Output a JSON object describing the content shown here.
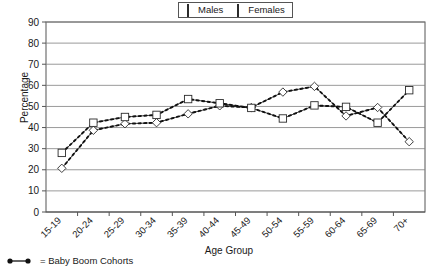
{
  "chart_data": {
    "type": "line",
    "title": "",
    "xlabel": "Age Group",
    "ylabel": "Percentage",
    "ylim": [
      0,
      90
    ],
    "ytick_step": 10,
    "yticks": [
      0,
      10,
      20,
      30,
      40,
      50,
      60,
      70,
      80,
      90
    ],
    "grid": "horizontal",
    "legend_position": "top-center",
    "categories": [
      "15-19",
      "20-24",
      "25-29",
      "30-34",
      "35-39",
      "40-44",
      "45-49",
      "50-54",
      "55-59",
      "60-64",
      "65-69",
      "70+"
    ],
    "series": [
      {
        "name": "Males",
        "marker": "diamond",
        "values": [
          20.7,
          38.7,
          41.8,
          42.3,
          46.5,
          50.3,
          49.5,
          56.8,
          59.5,
          45.5,
          49.5,
          33.3
        ]
      },
      {
        "name": "Females",
        "marker": "square",
        "values": [
          28.0,
          42.3,
          45.0,
          46.0,
          53.5,
          51.5,
          49.3,
          44.3,
          50.5,
          49.8,
          42.3,
          57.7
        ]
      }
    ],
    "annotations": [
      {
        "name": "baby-boom-cohorts",
        "style": "dotted-line-with-round-markers",
        "text": "= Baby Boom Cohorts",
        "description": "Dotted trend overlay connecting the Baby Boom cohort data points"
      }
    ],
    "colors": {
      "series_line": "#2b2b2b",
      "marker_fill": "#ffffff",
      "marker_stroke": "#2b2b2b",
      "grid": "#808080",
      "axis": "#555555",
      "dotted_overlay": "#111111",
      "background": "#ffffff"
    }
  },
  "legend": {
    "items": [
      {
        "label": "Males",
        "marker": "diamond-marker"
      },
      {
        "label": "Females",
        "marker": "square-marker"
      }
    ]
  },
  "footnote": {
    "text": "= Baby Boom Cohorts",
    "marker": "dotted-line-marker"
  },
  "axes": {
    "y": {
      "label": "Percentage"
    },
    "x": {
      "label": "Age Group"
    }
  }
}
